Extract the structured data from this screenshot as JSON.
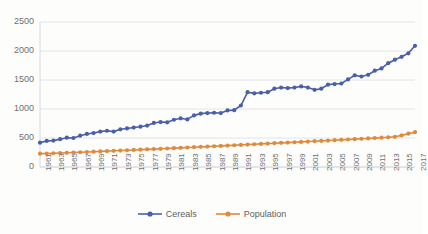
{
  "chart_data": {
    "type": "line",
    "title": "",
    "subtitle": "",
    "xlabel": "",
    "ylabel": "",
    "ylim": [
      0,
      2500
    ],
    "ytick_step": 500,
    "yticks": [
      "0",
      "500",
      "1000",
      "1500",
      "2000",
      "2500"
    ],
    "grid": true,
    "legend_position": "bottom",
    "x": [
      1961,
      1962,
      1963,
      1964,
      1965,
      1966,
      1967,
      1968,
      1969,
      1970,
      1971,
      1972,
      1973,
      1974,
      1975,
      1976,
      1977,
      1978,
      1979,
      1980,
      1981,
      1982,
      1983,
      1984,
      1985,
      1986,
      1987,
      1988,
      1989,
      1990,
      1991,
      1992,
      1993,
      1994,
      1995,
      1996,
      1997,
      1998,
      1999,
      2000,
      2001,
      2002,
      2003,
      2004,
      2005,
      2006,
      2007,
      2008,
      2009,
      2010,
      2011,
      2012,
      2013,
      2014,
      2015,
      2016,
      2017
    ],
    "xtick_labels": [
      "1961",
      "1963",
      "1965",
      "1967",
      "1969",
      "1971",
      "1973",
      "1975",
      "1977",
      "1979",
      "1981",
      "1983",
      "1985",
      "1987",
      "1989",
      "1991",
      "1993",
      "1995",
      "1997",
      "1999",
      "2001",
      "2003",
      "2005",
      "2007",
      "2009",
      "2011",
      "2013",
      "2015",
      "2017"
    ],
    "series": [
      {
        "name": "Cereals",
        "color": "#4A5FAB",
        "marker": "circle",
        "values": [
          420,
          450,
          455,
          480,
          505,
          500,
          540,
          570,
          585,
          610,
          625,
          610,
          650,
          665,
          680,
          695,
          715,
          760,
          775,
          770,
          815,
          840,
          820,
          890,
          920,
          930,
          935,
          930,
          975,
          980,
          1060,
          1290,
          1270,
          1280,
          1290,
          1350,
          1370,
          1360,
          1370,
          1390,
          1370,
          1330,
          1350,
          1420,
          1430,
          1440,
          1510,
          1580,
          1560,
          1590,
          1660,
          1700,
          1790,
          1850,
          1900,
          1960,
          2090
        ]
      },
      {
        "name": "Population",
        "color": "#E08A3C",
        "marker": "circle",
        "values": [
          230,
          233,
          237,
          241,
          245,
          250,
          254,
          259,
          264,
          269,
          274,
          279,
          284,
          289,
          294,
          299,
          304,
          309,
          314,
          319,
          325,
          330,
          336,
          341,
          347,
          352,
          358,
          364,
          369,
          375,
          381,
          387,
          392,
          398,
          404,
          410,
          416,
          421,
          427,
          433,
          439,
          445,
          450,
          456,
          462,
          468,
          474,
          480,
          486,
          492,
          498,
          505,
          512,
          520,
          545,
          575,
          600
        ]
      }
    ]
  },
  "legend": {
    "items": [
      {
        "label": "Cereals",
        "color": "#4A5FAB"
      },
      {
        "label": "Population",
        "color": "#E08A3C"
      }
    ]
  }
}
